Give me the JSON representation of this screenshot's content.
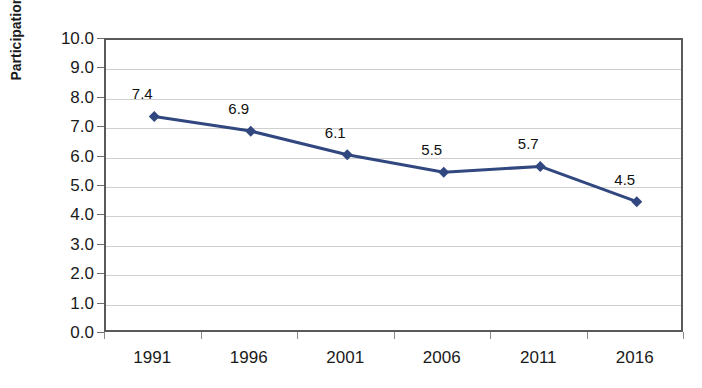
{
  "chart_data": {
    "type": "line",
    "title": "",
    "xlabel": "",
    "ylabel": "Participation Rate",
    "categories": [
      "1991",
      "1996",
      "2001",
      "2006",
      "2011",
      "2016"
    ],
    "values": [
      7.4,
      6.9,
      6.1,
      5.5,
      5.7,
      4.5
    ],
    "data_labels": [
      "7.4",
      "6.9",
      "6.1",
      "5.5",
      "5.7",
      "4.5"
    ],
    "series": [
      {
        "name": "Participation Rate",
        "values": [
          7.4,
          6.9,
          6.1,
          5.5,
          5.7,
          4.5
        ],
        "color": "#31477F",
        "marker": "diamond"
      }
    ],
    "ylim": [
      0.0,
      10.0
    ],
    "ytick_step": 1.0,
    "ytick_labels": [
      "10.0",
      "9.0",
      "8.0",
      "7.0",
      "6.0",
      "5.0",
      "4.0",
      "3.0",
      "2.0",
      "1.0",
      "0.0"
    ],
    "ytick_values": [
      10.0,
      9.0,
      8.0,
      7.0,
      6.0,
      5.0,
      4.0,
      3.0,
      2.0,
      1.0,
      0.0
    ],
    "grid": true,
    "grid_axis": "y",
    "legend": false,
    "legend_position": "none",
    "plot_border": true
  },
  "axes": {
    "y_title": "Participation Rate"
  },
  "colors": {
    "series_line": "#31477F",
    "marker_fill": "#31477F",
    "gridline": "#cfcfcf",
    "plot_border": "#5a5a5a",
    "tick_text": "#1a1a1a",
    "background": "#ffffff"
  }
}
